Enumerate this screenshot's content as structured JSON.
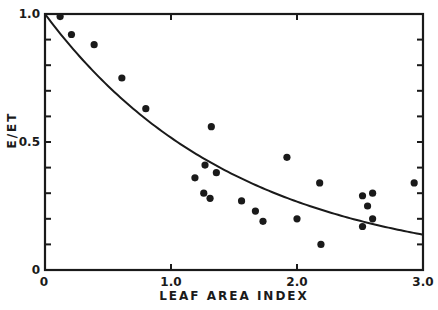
{
  "chart_data": {
    "type": "scatter",
    "title": "",
    "xlabel": "LEAF AREA INDEX",
    "ylabel": "E/ET",
    "xlim": [
      0,
      3.0
    ],
    "ylim": [
      0,
      1.0
    ],
    "x_ticks": [
      {
        "value": 0,
        "label": "0"
      },
      {
        "value": 1.0,
        "label": "1.0"
      },
      {
        "value": 2.0,
        "label": "2.0"
      },
      {
        "value": 3.0,
        "label": "3.0"
      }
    ],
    "y_ticks": [
      {
        "value": 0,
        "label": "0"
      },
      {
        "value": 0.5,
        "label": "0.5"
      },
      {
        "value": 1.0,
        "label": "1.0"
      }
    ],
    "y_minor_step": 0.1,
    "grid": false,
    "legend": null,
    "series": [
      {
        "name": "observed",
        "kind": "scatter",
        "points": [
          {
            "x": 0.12,
            "y": 0.99
          },
          {
            "x": 0.21,
            "y": 0.92
          },
          {
            "x": 0.39,
            "y": 0.88
          },
          {
            "x": 0.61,
            "y": 0.75
          },
          {
            "x": 0.8,
            "y": 0.63
          },
          {
            "x": 1.19,
            "y": 0.36
          },
          {
            "x": 1.26,
            "y": 0.3
          },
          {
            "x": 1.27,
            "y": 0.41
          },
          {
            "x": 1.31,
            "y": 0.28
          },
          {
            "x": 1.32,
            "y": 0.56
          },
          {
            "x": 1.36,
            "y": 0.38
          },
          {
            "x": 1.56,
            "y": 0.27
          },
          {
            "x": 1.67,
            "y": 0.23
          },
          {
            "x": 1.73,
            "y": 0.19
          },
          {
            "x": 1.92,
            "y": 0.44
          },
          {
            "x": 2.0,
            "y": 0.2
          },
          {
            "x": 2.18,
            "y": 0.34
          },
          {
            "x": 2.19,
            "y": 0.1
          },
          {
            "x": 2.52,
            "y": 0.29
          },
          {
            "x": 2.52,
            "y": 0.17
          },
          {
            "x": 2.56,
            "y": 0.25
          },
          {
            "x": 2.6,
            "y": 0.3
          },
          {
            "x": 2.6,
            "y": 0.2
          },
          {
            "x": 2.93,
            "y": 0.34
          }
        ]
      },
      {
        "name": "fitted curve",
        "kind": "line",
        "equation": "E/ET = exp(-0.66 * LAI)",
        "coefficient": 0.66
      }
    ]
  },
  "colors": {
    "ink": "#1a1a1a",
    "background": "#ffffff"
  }
}
